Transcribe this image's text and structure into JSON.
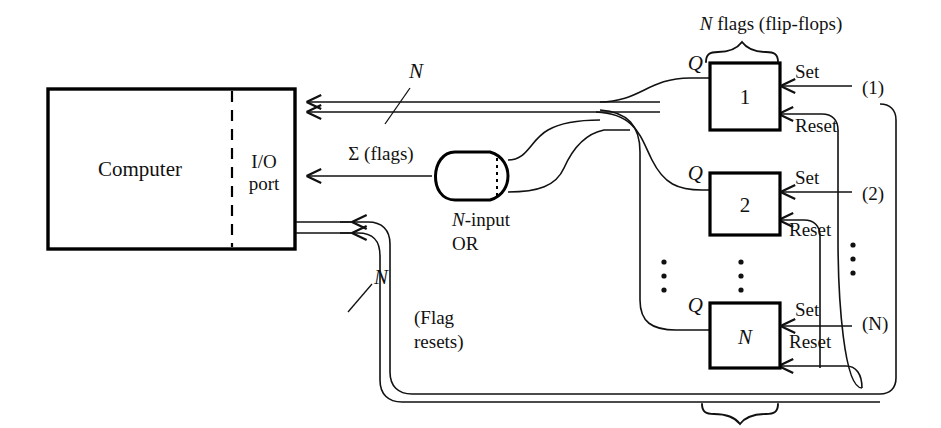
{
  "figure": {
    "title_label": "N flags (flip-flops)",
    "computer": {
      "name": "Computer",
      "port_line1": "I/O",
      "port_line2": "port"
    },
    "gate": {
      "line1": "N-input",
      "line2": "OR",
      "name_italic_prefix": "N",
      "name_rest": "-input"
    },
    "signals": {
      "flag_bus_width": "N",
      "sum_flags": "Σ (flags)",
      "reset_bus_width": "N",
      "flag_resets_line1": "(Flag",
      "flag_resets_line2": "resets)"
    },
    "flipflops": [
      {
        "id": "1",
        "q_label": "Q",
        "set_label": "Set",
        "reset_label": "Reset",
        "source_label": "(1)"
      },
      {
        "id": "2",
        "q_label": "Q",
        "set_label": "Set",
        "reset_label": "Reset",
        "source_label": "(2)"
      },
      {
        "id": "N",
        "q_label": "Q",
        "set_label": "Set",
        "reset_label": "Reset",
        "source_label": "(N)"
      }
    ],
    "ellipsis": {
      "glyph": "⋮"
    },
    "colors": {
      "background": "#ffffff",
      "ink": "#111111",
      "box_stroke": "#000000"
    }
  }
}
